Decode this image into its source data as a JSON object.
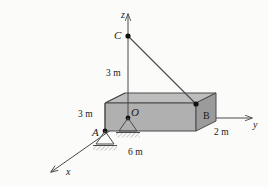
{
  "figure": {
    "background_color": "#fbfbfa",
    "line_color": "#4a4a4a",
    "slab_top_color": "#b9b9b9",
    "slab_front_color": "#a8a8a8",
    "slab_right_color": "#9a9a9a"
  },
  "points": {
    "origin": "O",
    "support_a": "A",
    "cable_top": "C",
    "corner_b": "B"
  },
  "axes": {
    "x": "x",
    "y": "y",
    "z": "z"
  },
  "dimensions": {
    "height_oc": "3 m",
    "height_slab": "3 m",
    "length_x": "6 m",
    "width_y": "2 m"
  }
}
